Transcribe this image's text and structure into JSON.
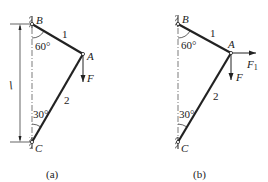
{
  "figures": [
    {
      "id": "a",
      "caption": "(a)",
      "points": {
        "B": "B",
        "A": "A",
        "C": "C"
      },
      "members": {
        "rod1": "1",
        "rod2": "2"
      },
      "angles": {
        "top": "60°",
        "bottom": "30°"
      },
      "forces": {
        "vertical": "F"
      },
      "dimension": "l"
    },
    {
      "id": "b",
      "caption": "(b)",
      "points": {
        "B": "B",
        "A": "A",
        "C": "C"
      },
      "members": {
        "rod1": "1",
        "rod2": "2"
      },
      "angles": {
        "top": "60°",
        "bottom": "30°"
      },
      "forces": {
        "vertical": "F",
        "horizontal": "F",
        "horizontal_sub": "1"
      }
    }
  ],
  "colors": {
    "line": "#222222",
    "background": "#ffffff"
  }
}
